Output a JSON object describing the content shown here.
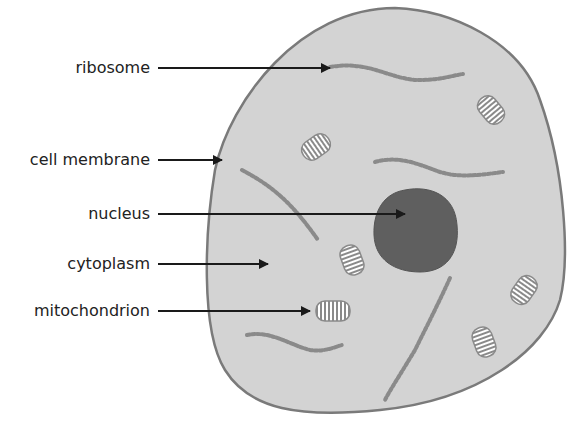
{
  "labels": [
    {
      "text": "ribosome",
      "target": "ribosome"
    },
    {
      "text": "cell membrane",
      "target": "cell membrane"
    },
    {
      "text": "nucleus",
      "target": "nucleus"
    },
    {
      "text": "cytoplasm",
      "target": "cytoplasm"
    },
    {
      "text": "mitochondrion",
      "target": "mitochondrion"
    }
  ],
  "colors": {
    "cytoplasm": "#d3d3d3",
    "membrane": "#7a7a7a",
    "nucleus": "#5f5f5f",
    "ribosome_strand": "#8a8a8a",
    "arrow": "#1a1a1a"
  }
}
